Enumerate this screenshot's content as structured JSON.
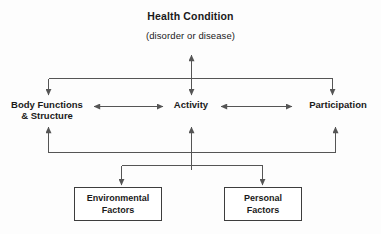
{
  "diagram": {
    "name": "ICF model of functioning and disability",
    "type": "flow-diagram",
    "colors": {
      "background": "#fdfdfd",
      "line": "#555555",
      "text": "#1a1a1a",
      "box_border": "#3d3d3d",
      "box_fill": "#ffffff"
    }
  },
  "header": {
    "title": "Health Condition",
    "subtitle": "(disorder or disease)"
  },
  "nodes": {
    "body_functions": {
      "line1": "Body Functions",
      "line2": "& Structure"
    },
    "activity": {
      "label": "Activity"
    },
    "participation": {
      "label": "Participation"
    },
    "environmental_factors": {
      "line1": "Environmental",
      "line2": "Factors"
    },
    "personal_factors": {
      "line1": "Personal",
      "line2": "Factors"
    }
  },
  "connectors": [
    {
      "id": "health-to-activity",
      "from": "Health Condition",
      "to": "Activity",
      "arrow": "double",
      "orientation": "vertical"
    },
    {
      "id": "health-bus-to-body-functions",
      "from": "Health Condition",
      "to": "Body Functions & Structure",
      "arrow": "single",
      "orientation": "bracket-down-left"
    },
    {
      "id": "health-bus-to-participation",
      "from": "Health Condition",
      "to": "Participation",
      "arrow": "single",
      "orientation": "bracket-down-right"
    },
    {
      "id": "body-functions-to-activity",
      "from": "Body Functions & Structure",
      "to": "Activity",
      "arrow": "double",
      "orientation": "horizontal"
    },
    {
      "id": "activity-to-participation",
      "from": "Activity",
      "to": "Participation",
      "arrow": "double",
      "orientation": "horizontal"
    },
    {
      "id": "factors-bus-to-body-functions",
      "from": "Contextual Factors",
      "to": "Body Functions & Structure",
      "arrow": "single",
      "orientation": "bracket-up-left"
    },
    {
      "id": "factors-bus-to-activity",
      "from": "Contextual Factors",
      "to": "Activity",
      "arrow": "single",
      "orientation": "vertical-up"
    },
    {
      "id": "factors-bus-to-participation",
      "from": "Contextual Factors",
      "to": "Participation",
      "arrow": "single",
      "orientation": "bracket-up-right"
    },
    {
      "id": "environmental-factors-to-bus",
      "from": "Environmental Factors",
      "to": "Contextual Factors bus",
      "arrow": "single",
      "orientation": "vertical-down"
    },
    {
      "id": "personal-factors-to-bus",
      "from": "Personal Factors",
      "to": "Contextual Factors bus",
      "arrow": "single",
      "orientation": "vertical-down"
    }
  ]
}
